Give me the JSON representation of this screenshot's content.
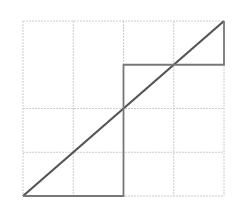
{
  "chart_data": {
    "type": "line",
    "title": "",
    "xlabel": "",
    "ylabel": "",
    "xlim": [
      0,
      1
    ],
    "ylim": [
      0,
      1
    ],
    "grid": true,
    "grid_x": [
      0,
      0.25,
      0.5,
      0.75,
      1
    ],
    "grid_y": [
      0,
      0.25,
      0.5,
      1
    ],
    "legend": null,
    "series": [
      {
        "name": "diagonal",
        "x": [
          0,
          1
        ],
        "y": [
          0,
          1
        ],
        "color": "#555555"
      },
      {
        "name": "step",
        "x": [
          0,
          0.5,
          0.5,
          1,
          1
        ],
        "y": [
          0,
          0,
          0.75,
          0.75,
          1
        ],
        "color": "#777777"
      }
    ]
  },
  "colors": {
    "grid": "#cccccc",
    "diagonal": "#555555",
    "step": "#777777",
    "background": "#ffffff"
  }
}
